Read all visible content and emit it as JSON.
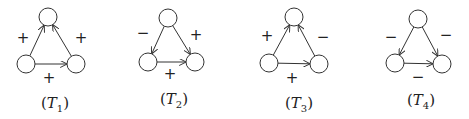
{
  "diagrams": [
    {
      "id": "T1",
      "caption": {
        "prefix": "(",
        "letter": "T",
        "sub": "1",
        "suffix": ")",
        "x": 55,
        "y": 108
      },
      "nodes": {
        "top": [
          48,
          17
        ],
        "left": [
          26,
          64
        ],
        "right": [
          76,
          64
        ]
      },
      "edges": [
        {
          "from": "left",
          "to": "top",
          "sign": "+",
          "label_pos": [
            23,
            38
          ]
        },
        {
          "from": "right",
          "to": "top",
          "sign": "+",
          "label_pos": [
            81,
            38
          ]
        },
        {
          "from": "left",
          "to": "right",
          "sign": "+",
          "label_pos": [
            49,
            78
          ]
        }
      ]
    },
    {
      "id": "T2",
      "caption": {
        "prefix": "(",
        "letter": "T",
        "sub": "2",
        "suffix": ")",
        "x": 174,
        "y": 104
      },
      "nodes": {
        "top": [
          168,
          18
        ],
        "left": [
          148,
          62
        ],
        "right": [
          195,
          62
        ]
      },
      "edges": [
        {
          "from": "top",
          "to": "left",
          "sign": "−",
          "label_pos": [
            143,
            33
          ]
        },
        {
          "from": "top",
          "to": "right",
          "sign": "+",
          "label_pos": [
            196,
            35
          ]
        },
        {
          "from": "left",
          "to": "right",
          "sign": "+",
          "label_pos": [
            170,
            74
          ]
        }
      ]
    },
    {
      "id": "T3",
      "caption": {
        "prefix": "(",
        "letter": "T",
        "sub": "3",
        "suffix": ")",
        "x": 299,
        "y": 108
      },
      "nodes": {
        "top": [
          294,
          17
        ],
        "left": [
          269,
          63
        ],
        "right": [
          319,
          64
        ]
      },
      "edges": [
        {
          "from": "left",
          "to": "top",
          "sign": "+",
          "label_pos": [
            267,
            36
          ]
        },
        {
          "from": "right",
          "to": "top",
          "sign": "−",
          "label_pos": [
            323,
            37
          ]
        },
        {
          "from": "left",
          "to": "right",
          "sign": "+",
          "label_pos": [
            292,
            78
          ]
        }
      ]
    },
    {
      "id": "T4",
      "caption": {
        "prefix": "(",
        "letter": "T",
        "sub": "4",
        "suffix": ")",
        "x": 421,
        "y": 105
      },
      "nodes": {
        "top": [
          418,
          19
        ],
        "left": [
          395,
          63
        ],
        "right": [
          442,
          64
        ]
      },
      "edges": [
        {
          "from": "top",
          "to": "left",
          "sign": "−",
          "label_pos": [
            391,
            37
          ]
        },
        {
          "from": "top",
          "to": "right",
          "sign": "−",
          "label_pos": [
            446,
            35
          ]
        },
        {
          "from": "left",
          "to": "right",
          "sign": "−",
          "label_pos": [
            418,
            77
          ]
        }
      ]
    }
  ],
  "style": {
    "stroke": "#333333",
    "node_radius": 9
  }
}
